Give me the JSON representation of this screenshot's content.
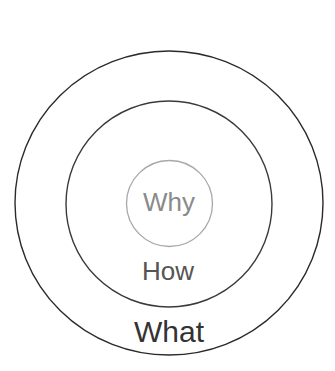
{
  "diagram": {
    "type": "golden-circle",
    "rings": [
      {
        "label": "Why",
        "color": "#8a8a8a",
        "stroke": "#a0a0a0"
      },
      {
        "label": "How",
        "color": "#555555",
        "stroke": "#3a3a3a"
      },
      {
        "label": "What",
        "color": "#333333",
        "stroke": "#2a2a2a"
      }
    ]
  }
}
